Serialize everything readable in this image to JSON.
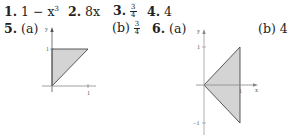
{
  "answers": {
    "a1": {
      "num": "1.",
      "text": "1 − x",
      "sup": "3"
    },
    "a2": {
      "num": "2.",
      "text": "8x"
    },
    "a3": {
      "num": "3.",
      "frac_num": "3",
      "frac_den": "4"
    },
    "a4": {
      "num": "4.",
      "text": "4"
    },
    "a5": {
      "num": "5.",
      "part_a": "(a)",
      "part_b": "(b)",
      "b_frac_num": "3",
      "b_frac_den": "4"
    },
    "a6": {
      "num": "6.",
      "part_a": "(a)",
      "part_b": "(b)",
      "b_value": "4"
    }
  },
  "graph5": {
    "y_label": "y",
    "x_label": "x",
    "y_tick": "1",
    "x_tick": "1",
    "fill": "#d4d4d4"
  },
  "graph6": {
    "y_label": "y",
    "x_label": "x",
    "y_tick_top": "1",
    "y_tick_bottom": "−1",
    "x_tick": "1",
    "fill": "#d4d4d4"
  }
}
